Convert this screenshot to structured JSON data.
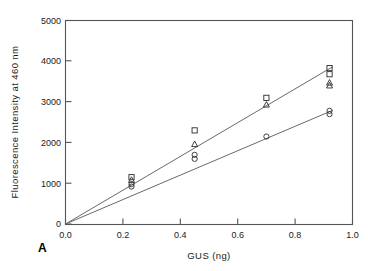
{
  "figure": {
    "panel_label": "A"
  },
  "chart_data": {
    "type": "scatter",
    "title": "",
    "subtitle": "",
    "xlabel": "GUS  (ng)",
    "ylabel": "Fluorescence  Intensity  at  460  nm",
    "xlim": [
      0.0,
      1.0
    ],
    "ylim": [
      0,
      5000
    ],
    "xticks": [
      0.0,
      0.2,
      0.4,
      0.6,
      0.8,
      1.0
    ],
    "xtick_labels": [
      "0.0",
      "0.2",
      "0.4",
      "0.6",
      "0.8",
      "1.0"
    ],
    "yticks": [
      0,
      1000,
      2000,
      3000,
      4000,
      5000
    ],
    "ytick_labels": [
      "0",
      "1000",
      "2000",
      "3000",
      "4000",
      "5000"
    ],
    "grid": false,
    "legend": "none",
    "legend_position": "none",
    "annotations": [
      "A"
    ],
    "series": [
      {
        "name": "open-square",
        "marker": "square",
        "filled": false,
        "points": [
          {
            "x": 0.23,
            "y": 1150
          },
          {
            "x": 0.45,
            "y": 2300
          },
          {
            "x": 0.7,
            "y": 3100
          },
          {
            "x": 0.92,
            "y": 3830
          },
          {
            "x": 0.92,
            "y": 3680
          }
        ]
      },
      {
        "name": "open-triangle",
        "marker": "triangle",
        "filled": false,
        "points": [
          {
            "x": 0.23,
            "y": 1080
          },
          {
            "x": 0.45,
            "y": 1960
          },
          {
            "x": 0.7,
            "y": 2930
          },
          {
            "x": 0.92,
            "y": 3470
          },
          {
            "x": 0.92,
            "y": 3400
          }
        ]
      },
      {
        "name": "open-circle",
        "marker": "circle",
        "filled": false,
        "points": [
          {
            "x": 0.23,
            "y": 980
          },
          {
            "x": 0.23,
            "y": 920
          },
          {
            "x": 0.45,
            "y": 1700
          },
          {
            "x": 0.45,
            "y": 1600
          },
          {
            "x": 0.7,
            "y": 2150
          },
          {
            "x": 0.92,
            "y": 2780
          },
          {
            "x": 0.92,
            "y": 2700
          }
        ]
      }
    ],
    "fit_lines": [
      {
        "name": "upper-fit",
        "intercept": 0,
        "slope": 4150,
        "x_start": 0.0,
        "x_end": 0.93
      },
      {
        "name": "lower-fit",
        "intercept": 0,
        "slope": 3000,
        "x_start": 0.0,
        "x_end": 0.93
      }
    ]
  }
}
